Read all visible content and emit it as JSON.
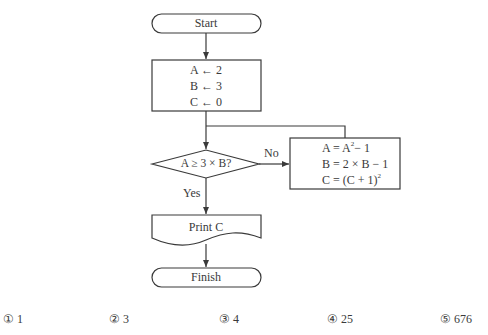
{
  "flowchart": {
    "start": {
      "label": "Start"
    },
    "init": {
      "lines": [
        "A ← 2",
        "B ← 3",
        "C ← 0"
      ]
    },
    "decision": {
      "label": "A ≥ 3 × B?",
      "no_label": "No",
      "yes_label": "Yes"
    },
    "process": {
      "line1_prefix": "A = A",
      "line1_exp": "2",
      "line1_suffix": "− 1",
      "line2": "B = 2 × B − 1",
      "line3_prefix": "C = (C + 1)",
      "line3_exp": "2"
    },
    "output": {
      "label": "Print C"
    },
    "end": {
      "label": "Finish"
    }
  },
  "answers": [
    {
      "marker": "①",
      "value": "1"
    },
    {
      "marker": "②",
      "value": "3"
    },
    {
      "marker": "③",
      "value": "4"
    },
    {
      "marker": "④",
      "value": "25"
    },
    {
      "marker": "⑤",
      "value": "676"
    }
  ],
  "colors": {
    "stroke": "#3a3a3a",
    "background": "#ffffff"
  }
}
